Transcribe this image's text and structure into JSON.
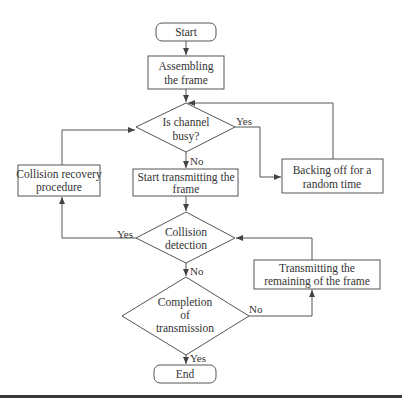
{
  "colors": {
    "stroke": "#555555",
    "text": "#333333",
    "bar": "#3a3a3a",
    "background": "#ffffff"
  },
  "nodes": {
    "start": {
      "label": "Start"
    },
    "assemble": {
      "line1": "Assembling",
      "line2": "the frame"
    },
    "channel_busy": {
      "line1": "Is channel",
      "line2": "busy?"
    },
    "start_transmit": {
      "line1": "Start transmitting the",
      "line2": "frame"
    },
    "backoff": {
      "line1": "Backing off for a",
      "line2": "random time"
    },
    "collision_recovery": {
      "line1": "Collision recovery",
      "line2": "procedure"
    },
    "collision_detection": {
      "line1": "Collision",
      "line2": "detection"
    },
    "transmit_remaining": {
      "line1": "Transmitting the",
      "line2": "remaining of the frame"
    },
    "completion": {
      "line1": "Completion",
      "line2": "of",
      "line3": "transmission"
    },
    "end": {
      "label": "End"
    }
  },
  "edge_labels": {
    "busy_yes": "Yes",
    "busy_no": "No",
    "collision_yes": "Yes",
    "collision_no": "No",
    "completion_no": "No",
    "completion_yes": "Yes"
  }
}
